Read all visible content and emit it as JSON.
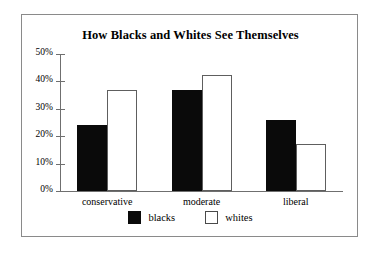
{
  "chart_data": {
    "type": "bar",
    "title": "How Blacks and Whites See Themselves",
    "xlabel": "",
    "ylabel": "",
    "categories": [
      "conservative",
      "moderate",
      "liberal"
    ],
    "series": [
      {
        "name": "blacks",
        "values": [
          24,
          37,
          26
        ],
        "color": "#0a0a0a",
        "style": "filled"
      },
      {
        "name": "whites",
        "values": [
          37,
          42.5,
          17
        ],
        "color": "#ffffff",
        "style": "outlined"
      }
    ],
    "ylim": [
      0,
      50
    ],
    "ytick_values": [
      50,
      40,
      30,
      20,
      10,
      0
    ],
    "ytick_labels": [
      "50%",
      "40%",
      "30%",
      "20%",
      "10%",
      "0%"
    ],
    "grid": false,
    "legend_position": "bottom-center",
    "frame": true
  },
  "legend": {
    "items": [
      {
        "label": "blacks",
        "swatch": "filled-black-square"
      },
      {
        "label": "whites",
        "swatch": "outlined-white-square"
      }
    ]
  }
}
